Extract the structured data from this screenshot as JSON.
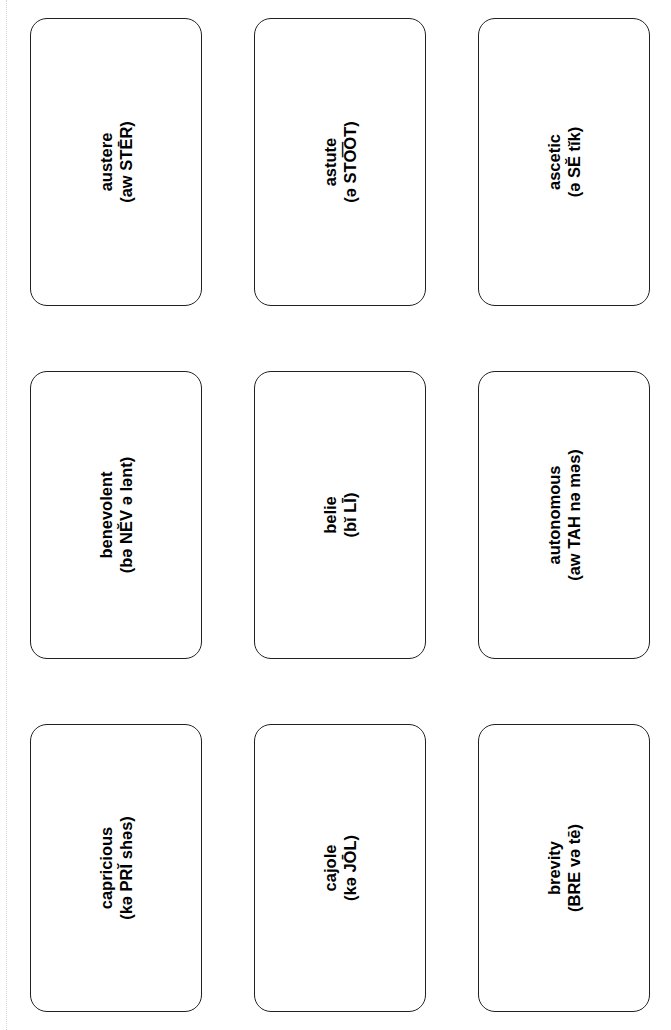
{
  "sheet": {
    "title": "Vocabulary Flashcard Sheet",
    "orientation": "text-rotated-90-ccw",
    "columns": 3,
    "rows": 3,
    "ink_color": "#231f20",
    "background_color": "#ffffff",
    "trim_guide_color": "#d9d6d2"
  },
  "cards": [
    {
      "term": "austere",
      "pronunciation": "(aw STĒR)"
    },
    {
      "term": "astute",
      "pronunciation": "(ə STO͞OT)"
    },
    {
      "term": "ascetic",
      "pronunciation": "(ə SĔ tĭk)"
    },
    {
      "term": "benevolent",
      "pronunciation": "(bə NĔV ə lənt)"
    },
    {
      "term": "belie",
      "pronunciation": "(bĭ LĪ)"
    },
    {
      "term": "autonomous",
      "pronunciation": "(aw TAH nə məs)"
    },
    {
      "term": "capricious",
      "pronunciation": "(kə PRĬ shəs)"
    },
    {
      "term": "cajole",
      "pronunciation": "(kə JŌL)"
    },
    {
      "term": "brevity",
      "pronunciation": "(BRE və tē)"
    }
  ]
}
